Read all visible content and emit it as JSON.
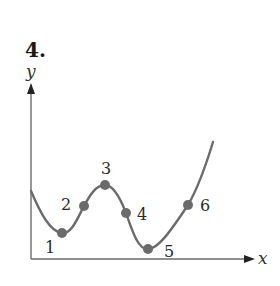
{
  "problem": {
    "number": "4."
  },
  "axes": {
    "y_label": "y",
    "x_label": "x"
  },
  "colors": {
    "curve": "#6b6b6b",
    "point": "#6b6b6b",
    "axis": "#6b6b6b",
    "text": "#2a2a2a"
  },
  "points": [
    {
      "label": "1",
      "cx": 62,
      "cy": 233,
      "lx": 45,
      "ly": 253
    },
    {
      "label": "2",
      "cx": 84,
      "cy": 206,
      "lx": 61,
      "ly": 210
    },
    {
      "label": "3",
      "cx": 105,
      "cy": 185,
      "lx": 101,
      "ly": 174
    },
    {
      "label": "4",
      "cx": 126,
      "cy": 213,
      "lx": 137,
      "ly": 220
    },
    {
      "label": "5",
      "cx": 148,
      "cy": 249,
      "lx": 164,
      "ly": 257
    },
    {
      "label": "6",
      "cx": 188,
      "cy": 205,
      "lx": 200,
      "ly": 211
    }
  ]
}
